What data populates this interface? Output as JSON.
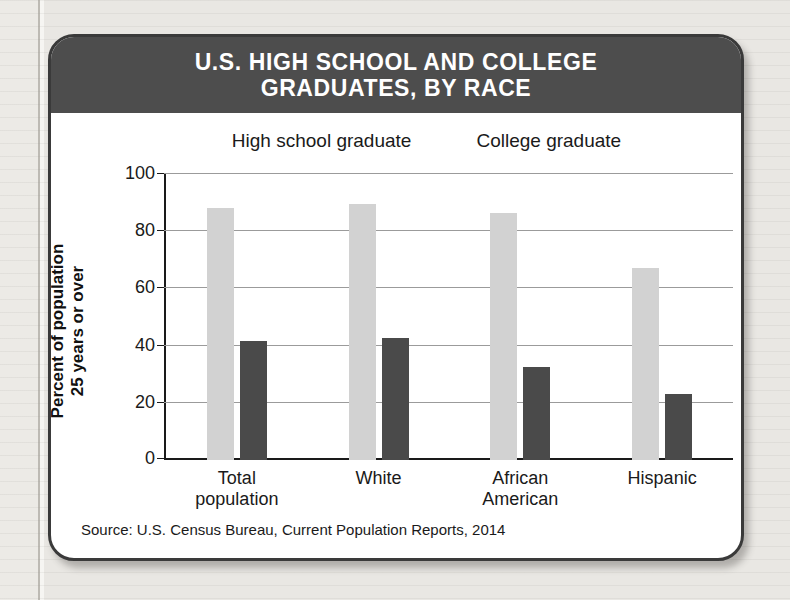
{
  "card": {
    "title_lines": [
      "U.S. HIGH SCHOOL AND COLLEGE",
      "GRADUATES, BY RACE"
    ],
    "source": "Source: U.S. Census Bureau, Current Population Reports, 2014"
  },
  "colors": {
    "banner": "#4d4d4d",
    "high_school_graduate": "#d2d2d2",
    "college_graduate": "#4a4a4a",
    "card_border": "#3a3a3a",
    "gridline": "#9b9b9b",
    "axis": "#1a1a1a",
    "page": "#e9e7e3"
  },
  "chart_data": {
    "type": "bar",
    "title": "U.S. HIGH SCHOOL AND COLLEGE GRADUATES, BY RACE",
    "xlabel": "",
    "ylabel": "Percent of population 25 years or over",
    "ylabel_lines": [
      "Percent of population",
      "25 years or over"
    ],
    "ylim": [
      0,
      100
    ],
    "yticks": [
      0,
      20,
      40,
      60,
      80,
      100
    ],
    "ytick_labels": [
      "0",
      "20",
      "40",
      "60",
      "80",
      "100"
    ],
    "grid": true,
    "legend_position": "top-center",
    "categories": [
      "Total population",
      "White",
      "African American",
      "Hispanic"
    ],
    "category_lines": [
      [
        "Total",
        "population"
      ],
      [
        "White"
      ],
      [
        "African",
        "American"
      ],
      [
        "Hispanic"
      ]
    ],
    "series": [
      {
        "name": "High school graduate",
        "color": "#d2d2d2",
        "values": [
          88,
          89.5,
          86.5,
          67
        ]
      },
      {
        "name": "College graduate",
        "color": "#4a4a4a",
        "values": [
          41.5,
          42.5,
          32.5,
          23
        ]
      }
    ],
    "source": "Source: U.S. Census Bureau, Current Population Reports, 2014"
  }
}
